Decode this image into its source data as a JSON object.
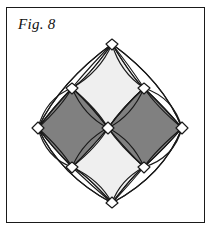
{
  "page": {
    "width": 213,
    "height": 232,
    "background_color": "#ffffff"
  },
  "frame": {
    "border_color": "#1a1a1a",
    "border_width": 1.4,
    "x": 6,
    "y": 7,
    "width": 199,
    "height": 216
  },
  "caption": {
    "label": "Fig. 8",
    "style": "italic-serif",
    "color": "#111111"
  },
  "figure": {
    "name": "curved-diamond-rosette",
    "stroke_color": "#1a1a1a",
    "stroke_width": 1.15,
    "fill_dark": "#808080",
    "fill_light": "#efefef",
    "fill_white": "#ffffff",
    "nodes": {
      "top": {
        "x": 112,
        "y": 44
      },
      "right": {
        "x": 182,
        "y": 128
      },
      "bottom": {
        "x": 112,
        "y": 203
      },
      "left": {
        "x": 38,
        "y": 128
      },
      "top_left": {
        "x": 72,
        "y": 88
      },
      "top_right": {
        "x": 144,
        "y": 88
      },
      "bottom_right": {
        "x": 144,
        "y": 167
      },
      "bottom_left": {
        "x": 72,
        "y": 167
      },
      "center": {
        "x": 108,
        "y": 128
      }
    },
    "quadrants": [
      {
        "name": "north-quadrant",
        "fill": "#efefef"
      },
      {
        "name": "east-quadrant",
        "fill": "#808080"
      },
      {
        "name": "south-quadrant",
        "fill": "#efefef"
      },
      {
        "name": "west-quadrant",
        "fill": "#808080"
      }
    ],
    "outer_petals": [
      {
        "name": "north-west-outer-petal",
        "fill": "#ffffff"
      },
      {
        "name": "north-east-outer-petal",
        "fill": "#ffffff"
      },
      {
        "name": "south-east-outer-petal",
        "fill": "#ffffff"
      },
      {
        "name": "south-west-outer-petal",
        "fill": "#ffffff"
      }
    ]
  }
}
